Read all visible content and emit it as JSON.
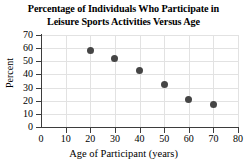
{
  "chart_data": {
    "type": "scatter",
    "title": "Percentage of Individuals Who Participate in Leisure Sports Activities Versus Age",
    "title_lines": [
      "Percentage of Individuals Who Participate in",
      "Leisure Sports Activities Versus Age"
    ],
    "xlabel": "Age of Participant (years)",
    "ylabel": "Percent",
    "x": [
      20,
      30,
      40,
      50,
      60,
      70
    ],
    "values": [
      58,
      52,
      43,
      32,
      21,
      17
    ],
    "points": [
      {
        "x": 20,
        "y": 58
      },
      {
        "x": 30,
        "y": 52
      },
      {
        "x": 40,
        "y": 43
      },
      {
        "x": 50,
        "y": 32
      },
      {
        "x": 60,
        "y": 21
      },
      {
        "x": 70,
        "y": 17
      }
    ],
    "xlim": [
      0,
      80
    ],
    "ylim": [
      0,
      70
    ],
    "xticks": [
      0,
      10,
      20,
      30,
      40,
      50,
      60,
      70,
      80
    ],
    "yticks": [
      0,
      10,
      20,
      30,
      40,
      50,
      60,
      70
    ],
    "xtick_labels": [
      "0",
      "10",
      "20",
      "30",
      "40",
      "50",
      "60",
      "70",
      "80"
    ],
    "ytick_labels": [
      "0",
      "10",
      "20",
      "30",
      "40",
      "50",
      "60",
      "70"
    ],
    "grid": true,
    "legend": null,
    "marker_color": "#454545",
    "grid_color": "#e2e2e2",
    "axis_color": "#3d3d3d",
    "background_color": "#ffffff"
  }
}
